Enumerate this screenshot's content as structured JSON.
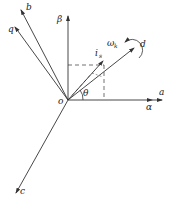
{
  "diagram": {
    "type": "vector-reference-frames",
    "origin_label": "o",
    "axes": [
      {
        "name": "a",
        "label": "a"
      },
      {
        "name": "alpha",
        "label": "α"
      },
      {
        "name": "beta",
        "label": "β"
      },
      {
        "name": "b",
        "label": "b"
      },
      {
        "name": "c",
        "label": "c"
      },
      {
        "name": "d",
        "label": "d"
      },
      {
        "name": "q",
        "label": "q"
      }
    ],
    "vector": {
      "label": "i",
      "subscript": "s"
    },
    "angle": {
      "label": "θ"
    },
    "rotation": {
      "label": "ω",
      "subscript": "k"
    },
    "colors": {
      "line": "#333333",
      "background": "#ffffff"
    }
  }
}
